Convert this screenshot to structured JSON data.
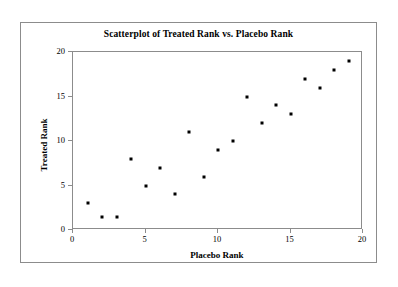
{
  "chart_data": {
    "type": "scatter",
    "title": "Scatterplot of Treated Rank vs. Placebo Rank",
    "xlabel": "Placebo Rank",
    "ylabel": "Treated Rank",
    "xlim": [
      0,
      20
    ],
    "ylim": [
      0,
      20
    ],
    "xticks": [
      "0",
      "5",
      "10",
      "15",
      "20"
    ],
    "yticks": [
      "0",
      "5",
      "10",
      "15",
      "20"
    ],
    "xtick_values": [
      0,
      5,
      10,
      15,
      20
    ],
    "ytick_values": [
      0,
      5,
      10,
      15,
      20
    ],
    "grid": false,
    "legend": null,
    "marker": "filled-square",
    "marker_color": "#000000",
    "x": [
      1,
      2,
      3,
      4,
      5,
      6,
      7,
      8,
      9,
      10,
      11,
      12,
      13,
      14,
      15,
      16,
      17,
      18,
      19
    ],
    "y": [
      3,
      1.5,
      1.5,
      8,
      5,
      7,
      4,
      11,
      6,
      9,
      10,
      15,
      12,
      14,
      13,
      17,
      16,
      18,
      19
    ],
    "points": [
      {
        "x": 1,
        "y": 3
      },
      {
        "x": 2,
        "y": 1.5
      },
      {
        "x": 3,
        "y": 1.5
      },
      {
        "x": 4,
        "y": 8
      },
      {
        "x": 5,
        "y": 5
      },
      {
        "x": 6,
        "y": 7
      },
      {
        "x": 7,
        "y": 4
      },
      {
        "x": 8,
        "y": 11
      },
      {
        "x": 9,
        "y": 6
      },
      {
        "x": 10,
        "y": 9
      },
      {
        "x": 11,
        "y": 10
      },
      {
        "x": 12,
        "y": 15
      },
      {
        "x": 13,
        "y": 12
      },
      {
        "x": 14,
        "y": 14
      },
      {
        "x": 15,
        "y": 13
      },
      {
        "x": 16,
        "y": 17
      },
      {
        "x": 17,
        "y": 16
      },
      {
        "x": 18,
        "y": 18
      },
      {
        "x": 19,
        "y": 19
      }
    ]
  },
  "colors": {
    "frame": "#8c8c8c",
    "axis": "#8c8c8c",
    "marker": "#000000",
    "text": "#000000",
    "background": "#ffffff"
  }
}
